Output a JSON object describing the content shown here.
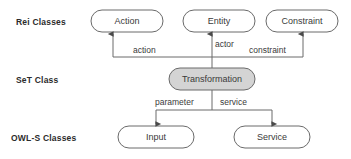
{
  "diagram": {
    "background_color": "#ffffff",
    "stroke_color": "#555555",
    "node_fill_default": "#ffffff",
    "node_fill_highlight": "#d4d4d4",
    "text_color": "#3a3a3a",
    "row_labels": [
      {
        "id": "rei",
        "text": "Rei Classes"
      },
      {
        "id": "set",
        "text": "SeT Class"
      },
      {
        "id": "owls",
        "text": "OWL-S Classes"
      }
    ],
    "nodes": [
      {
        "id": "action",
        "label": "Action",
        "row": "rei",
        "fill": "#ffffff"
      },
      {
        "id": "entity",
        "label": "Entity",
        "row": "rei",
        "fill": "#ffffff"
      },
      {
        "id": "constraint",
        "label": "Constraint",
        "row": "rei",
        "fill": "#ffffff"
      },
      {
        "id": "transformation",
        "label": "Transformation",
        "row": "set",
        "fill": "#d4d4d4"
      },
      {
        "id": "input",
        "label": "Input",
        "row": "owls",
        "fill": "#ffffff"
      },
      {
        "id": "service",
        "label": "Service",
        "row": "owls",
        "fill": "#ffffff"
      }
    ],
    "edges": [
      {
        "id": "action-edge",
        "label": "action",
        "from": "transformation",
        "to": "action",
        "direction": "up"
      },
      {
        "id": "actor-edge",
        "label": "actor",
        "from": "transformation",
        "to": "entity",
        "direction": "up"
      },
      {
        "id": "constraint-edge",
        "label": "constraint",
        "from": "transformation",
        "to": "constraint",
        "direction": "up"
      },
      {
        "id": "parameter-edge",
        "label": "parameter",
        "from": "transformation",
        "to": "input",
        "direction": "down"
      },
      {
        "id": "service-edge",
        "label": "service",
        "from": "transformation",
        "to": "service",
        "direction": "down"
      }
    ]
  }
}
